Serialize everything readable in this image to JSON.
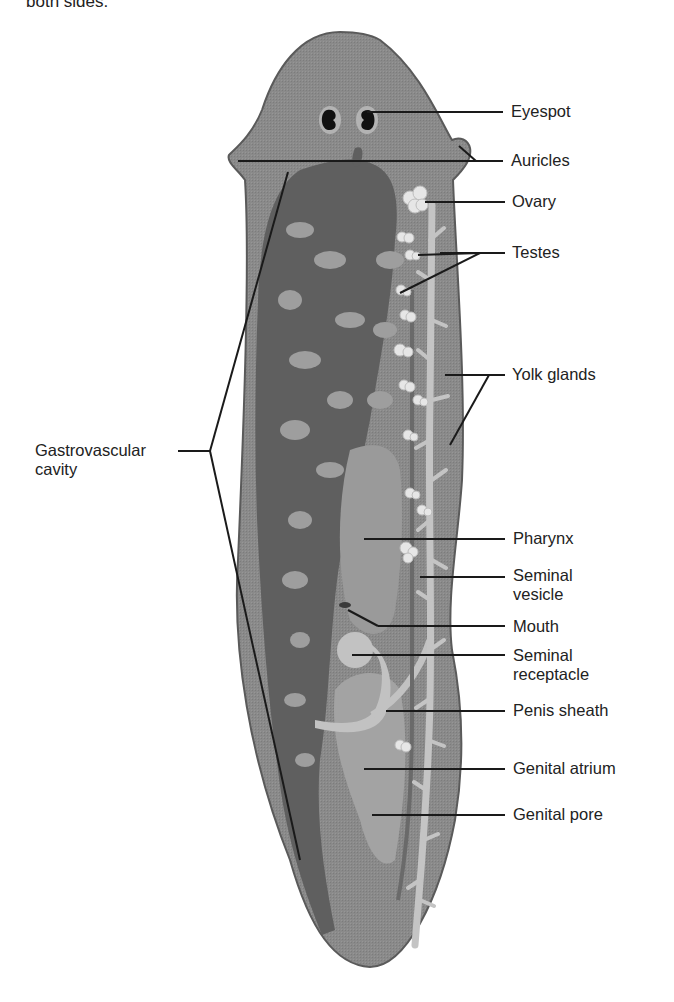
{
  "header": {
    "cut_off_text": "both sides."
  },
  "figure": {
    "colors": {
      "body": "#8a8a8a",
      "body_outline": "#555555",
      "gut": "#5e5e5e",
      "gut_light": "#a0a0a0",
      "reproductive": "#c6c6c6",
      "gonads": "#e8e8e8",
      "leader": "#1a1a1a",
      "label_text": "#222222"
    },
    "labels": {
      "eyespot": "Eyespot",
      "auricles": "Auricles",
      "ovary": "Ovary",
      "testes": "Testes",
      "yolk_glands": "Yolk glands",
      "gastrovascular_line1": "Gastrovascular",
      "gastrovascular_line2": "cavity",
      "pharynx": "Pharynx",
      "seminal_vesicle_line1": "Seminal",
      "seminal_vesicle_line2": "vesicle",
      "mouth": "Mouth",
      "seminal_receptacle_line1": "Seminal",
      "seminal_receptacle_line2": "receptacle",
      "penis_sheath": "Penis sheath",
      "genital_atrium": "Genital atrium",
      "genital_pore": "Genital pore"
    }
  }
}
